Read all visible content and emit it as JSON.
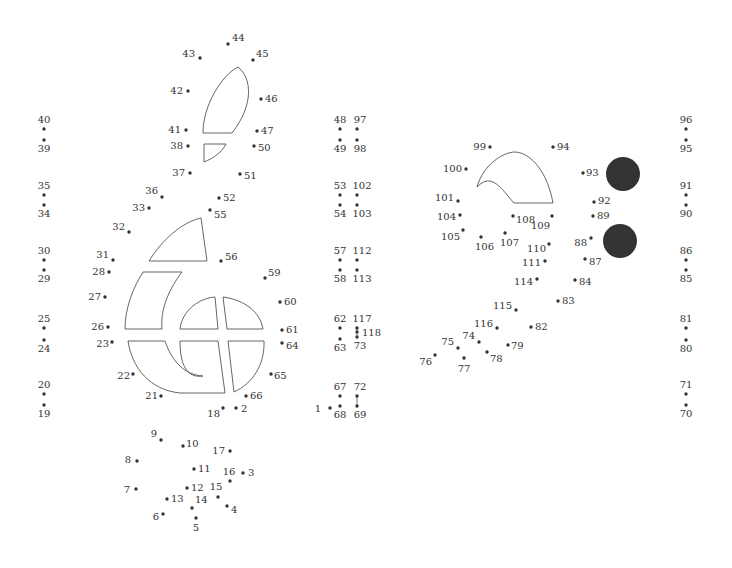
{
  "puzzle": {
    "type": "connect-the-dots",
    "dot_count": 118,
    "dot_color": "#333333",
    "line_color": "#555555",
    "filled_circle_color": "#333333",
    "dots": [
      {
        "n": "1"
      },
      {
        "n": "2"
      },
      {
        "n": "3"
      },
      {
        "n": "4"
      },
      {
        "n": "5"
      },
      {
        "n": "6"
      },
      {
        "n": "7"
      },
      {
        "n": "8"
      },
      {
        "n": "9"
      },
      {
        "n": "10"
      },
      {
        "n": "11"
      },
      {
        "n": "12"
      },
      {
        "n": "13"
      },
      {
        "n": "14"
      },
      {
        "n": "15"
      },
      {
        "n": "16"
      },
      {
        "n": "17"
      },
      {
        "n": "18"
      },
      {
        "n": "19"
      },
      {
        "n": "20"
      },
      {
        "n": "21"
      },
      {
        "n": "22"
      },
      {
        "n": "23"
      },
      {
        "n": "24"
      },
      {
        "n": "25"
      },
      {
        "n": "26"
      },
      {
        "n": "27"
      },
      {
        "n": "28"
      },
      {
        "n": "29"
      },
      {
        "n": "30"
      },
      {
        "n": "31"
      },
      {
        "n": "32"
      },
      {
        "n": "33"
      },
      {
        "n": "34"
      },
      {
        "n": "35"
      },
      {
        "n": "36"
      },
      {
        "n": "37"
      },
      {
        "n": "38"
      },
      {
        "n": "39"
      },
      {
        "n": "40"
      },
      {
        "n": "41"
      },
      {
        "n": "42"
      },
      {
        "n": "43"
      },
      {
        "n": "44"
      },
      {
        "n": "45"
      },
      {
        "n": "46"
      },
      {
        "n": "47"
      },
      {
        "n": "48"
      },
      {
        "n": "49"
      },
      {
        "n": "50"
      },
      {
        "n": "51"
      },
      {
        "n": "52"
      },
      {
        "n": "53"
      },
      {
        "n": "54"
      },
      {
        "n": "55"
      },
      {
        "n": "56"
      },
      {
        "n": "57"
      },
      {
        "n": "58"
      },
      {
        "n": "59"
      },
      {
        "n": "60"
      },
      {
        "n": "61"
      },
      {
        "n": "62"
      },
      {
        "n": "63"
      },
      {
        "n": "64"
      },
      {
        "n": "65"
      },
      {
        "n": "66"
      },
      {
        "n": "67"
      },
      {
        "n": "68"
      },
      {
        "n": "69"
      },
      {
        "n": "70"
      },
      {
        "n": "71"
      },
      {
        "n": "72"
      },
      {
        "n": "73"
      },
      {
        "n": "74"
      },
      {
        "n": "75"
      },
      {
        "n": "76"
      },
      {
        "n": "77"
      },
      {
        "n": "78"
      },
      {
        "n": "79"
      },
      {
        "n": "80"
      },
      {
        "n": "81"
      },
      {
        "n": "82"
      },
      {
        "n": "83"
      },
      {
        "n": "84"
      },
      {
        "n": "85"
      },
      {
        "n": "86"
      },
      {
        "n": "87"
      },
      {
        "n": "88"
      },
      {
        "n": "89"
      },
      {
        "n": "90"
      },
      {
        "n": "91"
      },
      {
        "n": "92"
      },
      {
        "n": "93"
      },
      {
        "n": "94"
      },
      {
        "n": "95"
      },
      {
        "n": "96"
      },
      {
        "n": "97"
      },
      {
        "n": "98"
      },
      {
        "n": "99"
      },
      {
        "n": "100"
      },
      {
        "n": "101"
      },
      {
        "n": "102"
      },
      {
        "n": "103"
      },
      {
        "n": "104"
      },
      {
        "n": "105"
      },
      {
        "n": "106"
      },
      {
        "n": "107"
      },
      {
        "n": "108"
      },
      {
        "n": "109"
      },
      {
        "n": "110"
      },
      {
        "n": "111"
      },
      {
        "n": "112"
      },
      {
        "n": "113"
      },
      {
        "n": "114"
      },
      {
        "n": "115"
      },
      {
        "n": "116"
      },
      {
        "n": "117"
      },
      {
        "n": "118"
      }
    ]
  }
}
